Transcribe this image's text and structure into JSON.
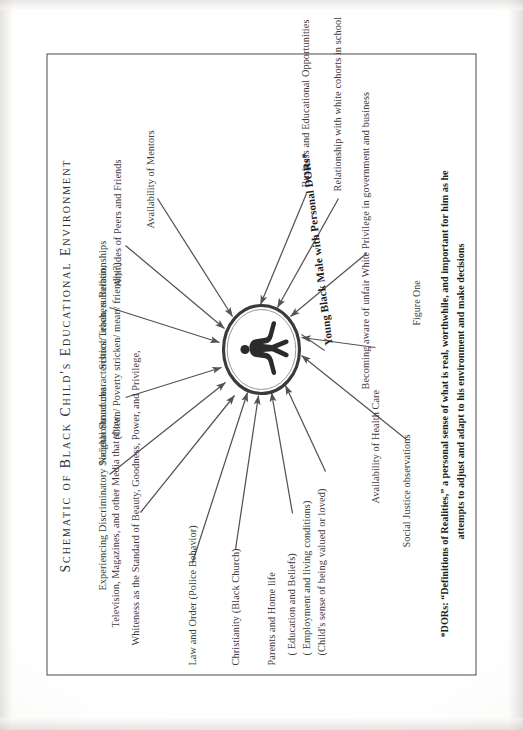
{
  "document": {
    "title": "SCHEMATIC OF BLACK CHILD'S EDUCATIONAL ENVIRONMENT",
    "title_display": "Schematic of Black Child's Educational Environment",
    "figure_caption": "Figure One"
  },
  "center": {
    "label": "Young Black Male with Personal DORs*",
    "icon": "human-figure-silhouette"
  },
  "factors": {
    "top_left": [
      "Television, Magazines, and other Media that show",
      "Whiteness as the Standard of Beauty, Goodness, Power, and Privilege,"
    ],
    "upper": [
      "Experiencing Discriminatory Societal Structures",
      "Neighborhood characteristics: urban, suburban,",
      "(Clean/ Poverty stricken/ mean/ friendly?)",
      "School/Teachers Relationships",
      "Attitudes of Peers and Friends",
      "Availability of Mentors"
    ],
    "left": [
      "Law and Order (Police Behavior)",
      "Christianity (Black Church)",
      "Parents and Home life",
      "( Education and Beliefs)",
      "( Employment and living conditions)",
      "(Child's sense of being valued or loved)"
    ],
    "lower": [
      "Business and Educational Opportunities",
      "Relationship with white cohorts in school",
      "Becoming aware of unfair White Privilege in government and business",
      "Availability of Health Care",
      "Social Justice observations"
    ]
  },
  "footnote": {
    "line1": "*DORs: “Definitions of Realities,” a personal sense of what is real, worthwhile, and important for him as he",
    "line2": "attempts to adjust and adapt to his environment and make decisions"
  },
  "colors": {
    "ink": "#3b3b3b",
    "ink_dark": "#1e1e1e",
    "arrow": "#55534f",
    "paper": "#ffffff",
    "frame": "#4a4a4a"
  }
}
